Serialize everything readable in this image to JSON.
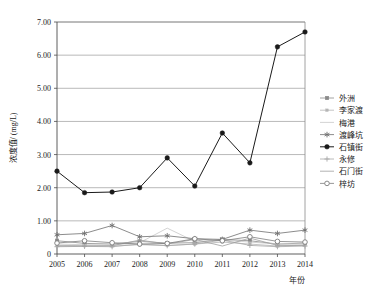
{
  "chart_data": {
    "type": "line",
    "title": "",
    "xlabel": "年份",
    "ylabel": "浓度值/ (mg/L)",
    "categories": [
      "2005",
      "2006",
      "2007",
      "2008",
      "2009",
      "2010",
      "2011",
      "2012",
      "2013",
      "2014"
    ],
    "x": [
      2005,
      2006,
      2007,
      2008,
      2009,
      2010,
      2011,
      2012,
      2013,
      2014
    ],
    "ylim": [
      0,
      7
    ],
    "xlim": [
      2005,
      2014
    ],
    "ytick_labels": [
      "0",
      "1.00",
      "2.00",
      "3.00",
      "4.00",
      "5.00",
      "6.00",
      "7.00"
    ],
    "ytick_values": [
      0,
      1,
      2,
      3,
      4,
      5,
      6,
      7
    ],
    "grid": true,
    "grid_axis": "y",
    "legend_position": "right",
    "series": [
      {
        "name": "外洲",
        "marker": "square",
        "color": "#8a8a8a",
        "values": [
          0.4,
          0.32,
          0.3,
          0.38,
          0.33,
          0.34,
          0.44,
          0.4,
          0.3,
          0.33
        ]
      },
      {
        "name": "李家渡",
        "marker": "square-small",
        "color": "#b5b5b5",
        "values": [
          0.26,
          0.25,
          0.24,
          0.28,
          0.26,
          0.3,
          0.36,
          0.3,
          0.24,
          0.27
        ]
      },
      {
        "name": "梅港",
        "marker": "none",
        "color": "#c8c8c8",
        "values": [
          0.3,
          0.28,
          0.27,
          0.34,
          0.78,
          0.38,
          0.42,
          0.36,
          0.3,
          0.3
        ]
      },
      {
        "name": "渡峰坑",
        "marker": "asterisk",
        "color": "#6e6e6e",
        "values": [
          0.58,
          0.62,
          0.86,
          0.52,
          0.55,
          0.46,
          0.44,
          0.72,
          0.62,
          0.72
        ]
      },
      {
        "name": "石镇街",
        "marker": "circle-filled",
        "color": "#1a1a1a",
        "values": [
          2.5,
          1.85,
          1.87,
          2.0,
          2.9,
          2.05,
          3.65,
          2.75,
          6.25,
          6.7
        ]
      },
      {
        "name": "永修",
        "marker": "plus",
        "color": "#a8a8a8",
        "values": [
          0.22,
          0.23,
          0.22,
          0.3,
          0.25,
          0.3,
          0.42,
          0.26,
          0.22,
          0.24
        ]
      },
      {
        "name": "石门街",
        "marker": "none",
        "color": "#9e9e9e",
        "values": [
          0.24,
          0.24,
          0.25,
          0.42,
          0.3,
          0.44,
          0.24,
          0.48,
          0.26,
          0.26
        ]
      },
      {
        "name": "梓坊",
        "marker": "circle-open",
        "color": "#7d7d7d",
        "values": [
          0.33,
          0.4,
          0.34,
          0.3,
          0.32,
          0.46,
          0.4,
          0.52,
          0.38,
          0.36
        ]
      }
    ]
  }
}
